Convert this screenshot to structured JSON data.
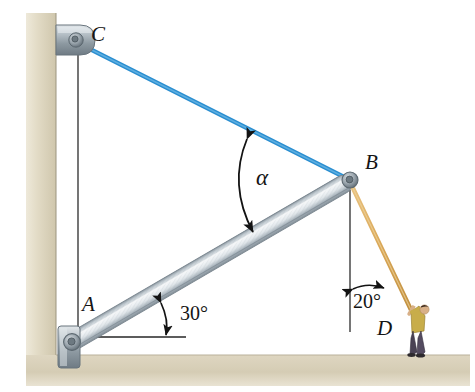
{
  "figure": {
    "type": "engineering-statics-diagram",
    "background_color": "#ffffff",
    "panel_color": "#ffffff",
    "wall_color": "#ddd6c0",
    "floor_color": "#d8d0bb",
    "outline_color": "#8e8878"
  },
  "labels": {
    "point_c": "C",
    "point_a": "A",
    "point_b": "B",
    "point_d": "D",
    "angle_alpha": "α",
    "angle_30": "30°",
    "angle_20": "20°"
  },
  "members": {
    "cable_bc": {
      "name": "cable-bc",
      "color": "#2a8ed0",
      "from": "C",
      "to": "B",
      "width_px": 4
    },
    "boom_ab": {
      "name": "boom-ab",
      "color": "#bcc6cd",
      "edge_color": "#7d8a94",
      "from": "A",
      "to": "B",
      "width_px": 17
    },
    "rope_bd": {
      "name": "rope-bd",
      "color": "#d9a757",
      "from": "B",
      "to": "D",
      "width_px": 4
    }
  },
  "geometry": {
    "point_c": {
      "x": 75,
      "y": 40
    },
    "point_a": {
      "x": 72,
      "y": 342
    },
    "point_b": {
      "x": 350,
      "y": 180
    },
    "point_d": {
      "x": 412,
      "y": 312
    },
    "reference_line_from_c": {
      "x": 78,
      "y1": 52,
      "y2": 345
    },
    "reference_line_from_b": {
      "x": 350,
      "y1": 190,
      "y2": 332
    },
    "horizontal_reference_at_a": {
      "x1": 95,
      "x2": 185,
      "y": 337
    }
  },
  "angles": [
    {
      "name": "alpha",
      "label": "α",
      "vertex": "B",
      "between": [
        "cable BC",
        "boom AB"
      ],
      "value": null
    },
    {
      "name": "beam-inclination",
      "label": "30°",
      "vertex": "A",
      "between": [
        "horizontal",
        "boom AB"
      ],
      "value": 30
    },
    {
      "name": "rope-inclination",
      "label": "20°",
      "vertex": "B",
      "between": [
        "vertical",
        "rope BD"
      ],
      "value": 20
    }
  ],
  "person": {
    "name": "worker",
    "shirt_color": "#c8ad4a",
    "pants_color": "#4a4254",
    "hair_color": "#3a2a20",
    "skin_color": "#d8b088",
    "shoe_color": "#2e2a2e",
    "pose": "arms raised pulling rope"
  },
  "hardware": {
    "bracket_color_light": "#cfd6da",
    "bracket_color_dark": "#7c8890",
    "pin_color": "#9aa5ad"
  }
}
